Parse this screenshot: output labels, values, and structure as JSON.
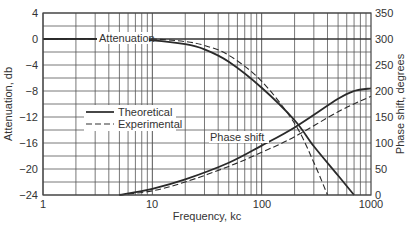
{
  "chart_data": {
    "type": "line",
    "title": "",
    "xlabel": "Frequency, kc",
    "ylabel": "Attenuation, db",
    "y2label": "Phase shift, degrees",
    "xscale": "log",
    "xlim": [
      1,
      1000
    ],
    "ylim": [
      -24,
      4
    ],
    "y2lim": [
      0,
      350
    ],
    "grid": true,
    "x_ticks": [
      "1",
      "10",
      "100",
      "1000"
    ],
    "y_ticks": [
      "4",
      "0",
      "-4",
      "-8",
      "-12",
      "-16",
      "-20",
      "-24"
    ],
    "y2_ticks": [
      "350",
      "300",
      "250",
      "200",
      "150",
      "100",
      "50",
      "0"
    ],
    "legend": {
      "position": "left-middle",
      "entries": [
        "Theoretical",
        "Experimental"
      ]
    },
    "annotations": [
      "Attenuation",
      "Phase shift"
    ],
    "series": [
      {
        "name": "Attenuation - Theoretical",
        "axis": "left",
        "style": "solid",
        "x": [
          1,
          5,
          10,
          20,
          30,
          50,
          100,
          200,
          300,
          500,
          700
        ],
        "y": [
          0,
          0,
          -0.2,
          -0.8,
          -1.6,
          -3.5,
          -7.5,
          -12.5,
          -16.5,
          -21,
          -24
        ]
      },
      {
        "name": "Attenuation - Experimental",
        "axis": "left",
        "style": "dashed",
        "x": [
          1,
          5,
          10,
          20,
          30,
          50,
          100,
          200,
          300,
          400
        ],
        "y": [
          0,
          0,
          0,
          -0.4,
          -1,
          -2.5,
          -6.5,
          -13,
          -19,
          -24
        ]
      },
      {
        "name": "Phase shift - Theoretical",
        "axis": "right",
        "style": "solid",
        "x": [
          5,
          10,
          20,
          50,
          100,
          200,
          500,
          700,
          1000
        ],
        "y": [
          0,
          12,
          30,
          62,
          95,
          130,
          185,
          200,
          205
        ]
      },
      {
        "name": "Phase shift - Experimental",
        "axis": "right",
        "style": "dashed",
        "x": [
          5,
          10,
          20,
          50,
          100,
          200,
          500,
          1000
        ],
        "y": [
          0,
          8,
          25,
          55,
          82,
          112,
          160,
          190
        ]
      }
    ]
  },
  "labels": {
    "xlabel": "Frequency, kc",
    "ylabel": "Attenuation, db",
    "y2label": "Phase shift, degrees",
    "attenuation": "Attenuation",
    "phase": "Phase shift",
    "legend_theoretical": "Theoretical",
    "legend_experimental": "Experimental",
    "x_ticks": [
      "1",
      "10",
      "100",
      "1000"
    ],
    "y_ticks": [
      "4",
      "0",
      "−24",
      "−4",
      "−8",
      "−12",
      "−16",
      "−20"
    ],
    "y_left": [
      "4",
      "0",
      "−4",
      "−8",
      "−12",
      "−16",
      "−20",
      "−24"
    ],
    "y_right": [
      "350",
      "300",
      "250",
      "200",
      "150",
      "100",
      "50",
      "0"
    ]
  }
}
